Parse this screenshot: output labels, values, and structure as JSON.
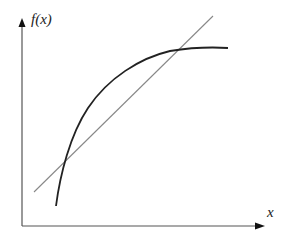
{
  "diagram": {
    "y_axis_label": "f(x)",
    "x_axis_label": "x",
    "elements": [
      {
        "name": "concave-curve",
        "description": "increasing concave function f(x)",
        "color": "#222222"
      },
      {
        "name": "secant-line",
        "description": "straight line intersecting the curve at two points",
        "color": "#888888"
      }
    ],
    "colors": {
      "axis": "#555555",
      "curve": "#222222",
      "line": "#888888",
      "background": "#ffffff"
    }
  }
}
